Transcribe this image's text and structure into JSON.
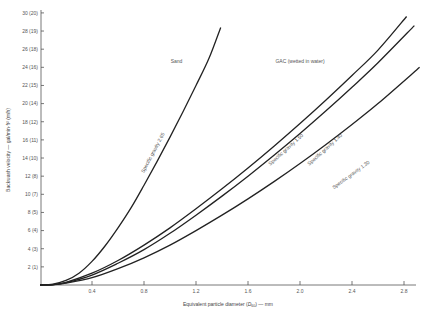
{
  "chart_data": {
    "type": "line",
    "title": "",
    "xlabel": "Equivalent particle diameter (D60) — mm",
    "xlabel_parts": {
      "prefix": "Equivalent particle diameter (",
      "symbol": "D",
      "subscript": "60",
      "suffix": ") — mm"
    },
    "ylabel": "Backwash velocity — gal/min·ft² (m/h)",
    "xlim": [
      0,
      2.95
    ],
    "ylim": [
      0,
      30
    ],
    "grid": false,
    "x_ticks": [
      0.4,
      0.8,
      1.2,
      1.6,
      2.0,
      2.4,
      2.8
    ],
    "x_tick_labels": [
      "0.4",
      "0.8",
      "1.2",
      "1.6",
      "2.0",
      "2.4",
      "2.8"
    ],
    "y_ticks": [
      2,
      4,
      6,
      8,
      10,
      12,
      14,
      16,
      18,
      20,
      22,
      24,
      26,
      28,
      30
    ],
    "y_tick_labels": [
      "2 (1)",
      "4 (3)",
      "6 (4)",
      "8 (5)",
      "10 (7)",
      "12 (8)",
      "14 (10)",
      "16 (11)",
      "18 (12)",
      "20 (14)",
      "22 (15)",
      "24 (16)",
      "26 (18)",
      "28 (19)",
      "30 (20)"
    ],
    "annotations": [
      {
        "text": "Sand",
        "x": 1.05,
        "y": 24.5
      },
      {
        "text": "GAC (wetted in water)",
        "x": 2.0,
        "y": 24.5
      }
    ],
    "series": [
      {
        "name": "Specific gravity 2.65",
        "group": "Sand",
        "x": [
          0.0,
          0.1,
          0.2,
          0.3,
          0.4,
          0.5,
          0.6,
          0.7,
          0.8,
          0.9,
          1.0,
          1.1,
          1.2,
          1.3,
          1.39
        ],
        "y": [
          0.0,
          0.1,
          0.5,
          1.3,
          2.6,
          4.3,
          6.3,
          8.5,
          11.0,
          13.6,
          16.3,
          19.1,
          22.0,
          25.0,
          28.4
        ],
        "label_pos": {
          "x": 0.88,
          "y": 14.5,
          "angle": -62
        }
      },
      {
        "name": "Specific gravity 1.50",
        "group": "GAC",
        "x": [
          0.0,
          0.1,
          0.2,
          0.4,
          0.6,
          0.8,
          1.0,
          1.2,
          1.4,
          1.6,
          1.8,
          2.0,
          2.2,
          2.4,
          2.6,
          2.82
        ],
        "y": [
          0.0,
          0.05,
          0.3,
          1.3,
          2.7,
          4.4,
          6.3,
          8.4,
          10.6,
          12.9,
          15.3,
          17.8,
          20.4,
          23.1,
          25.9,
          29.6
        ],
        "label_pos": {
          "x": 1.9,
          "y": 14.8,
          "angle": -42
        }
      },
      {
        "name": "Specific gravity 1.40",
        "group": "GAC",
        "x": [
          0.0,
          0.1,
          0.2,
          0.4,
          0.6,
          0.8,
          1.0,
          1.2,
          1.4,
          1.6,
          1.8,
          2.0,
          2.2,
          2.4,
          2.6,
          2.88
        ],
        "y": [
          0.0,
          0.05,
          0.25,
          1.1,
          2.4,
          3.9,
          5.7,
          7.7,
          9.8,
          12.0,
          14.3,
          16.7,
          19.2,
          21.8,
          24.5,
          28.6
        ],
        "label_pos": {
          "x": 2.2,
          "y": 14.8,
          "angle": -42
        }
      },
      {
        "name": "Specific gravity 1.30",
        "group": "GAC",
        "x": [
          0.0,
          0.1,
          0.2,
          0.4,
          0.6,
          0.8,
          1.0,
          1.2,
          1.4,
          1.6,
          1.8,
          2.0,
          2.2,
          2.4,
          2.6,
          2.92
        ],
        "y": [
          0.0,
          0.03,
          0.2,
          0.8,
          1.8,
          3.0,
          4.4,
          6.0,
          7.7,
          9.5,
          11.4,
          13.4,
          15.5,
          17.7,
          20.0,
          24.0
        ],
        "label_pos": {
          "x": 2.4,
          "y": 12.0,
          "angle": -36
        }
      }
    ]
  }
}
